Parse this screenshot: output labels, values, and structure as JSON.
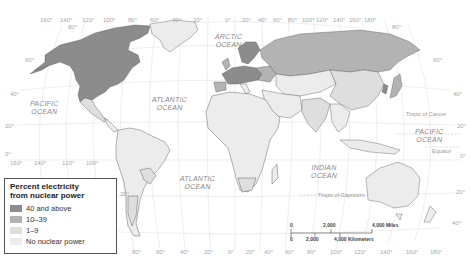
{
  "map": {
    "title": "Percent electricity from nuclear power",
    "colors": {
      "high": "#8c8c8c",
      "mid": "#b3b3b3",
      "low": "#dedede",
      "none": "#ececec",
      "ocean": "#ffffff",
      "grid": "#e0e0e0",
      "border": "#444444"
    },
    "top_longitudes": [
      "160°",
      "140°",
      "120°",
      "100°",
      "80°",
      "60°",
      "40°",
      "20°",
      "0°",
      "20°",
      "40°",
      "60°",
      "80°",
      "100°",
      "120°",
      "140°",
      "160°",
      "180°"
    ],
    "bottom_longitudes_left": [
      "160°",
      "140°",
      "120°",
      "100°"
    ],
    "bottom_longitudes_center": [
      "80°",
      "60°",
      "40°",
      "20°",
      "0°",
      "20°",
      "40°",
      "60°",
      "80°",
      "100°",
      "120°",
      "140°",
      "160°",
      "180°"
    ],
    "latitudes_left": [
      "80°",
      "60°",
      "40°",
      "20°",
      "0°",
      "20°",
      "40°"
    ],
    "latitudes_right": [
      "80°",
      "60°",
      "40°",
      "20°",
      "0°",
      "20°",
      "40°"
    ],
    "oceans": {
      "arctic": [
        "ARCTIC",
        "OCEAN"
      ],
      "pacific_west": [
        "PACIFIC",
        "OCEAN"
      ],
      "pacific_east": [
        "PACIFIC",
        "OCEAN"
      ],
      "atlantic_north": [
        "ATLANTIC",
        "OCEAN"
      ],
      "atlantic_south": [
        "ATLANTIC",
        "OCEAN"
      ],
      "indian": [
        "INDIAN",
        "OCEAN"
      ]
    },
    "lines": {
      "tropic_cancer": "Tropic of Cancer",
      "equator": "Equator",
      "tropic_capricorn": "Tropic of Capricorn"
    }
  },
  "legend": {
    "title_line1": "Percent electricity",
    "title_line2": "from nuclear power",
    "items": [
      {
        "label": "40 and above",
        "color": "#8c8c8c"
      },
      {
        "label": "10–39",
        "color": "#b3b3b3"
      },
      {
        "label": "1–9",
        "color": "#dedede"
      },
      {
        "label": "No nuclear power",
        "color": "#ececec"
      }
    ]
  },
  "scale": {
    "miles": {
      "start": "0",
      "mid": "2,000",
      "end": "4,000 Miles"
    },
    "km": {
      "start": "0",
      "mid": "2,000",
      "end": "4,000 Kilometers"
    }
  }
}
